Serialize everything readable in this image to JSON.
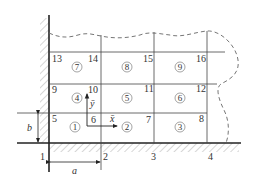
{
  "diagram": {
    "type": "finite element mesh of rectangular elements next to a wall and ground",
    "grid": {
      "x_lines": [
        49,
        101,
        154,
        207
      ],
      "y_lines": [
        52,
        84,
        113,
        143
      ]
    },
    "nodes": [
      {
        "id": "1",
        "label": "1",
        "x": 40,
        "y": 160
      },
      {
        "id": "2",
        "label": "2",
        "x": 103,
        "y": 160
      },
      {
        "id": "3",
        "label": "3",
        "x": 151,
        "y": 160
      },
      {
        "id": "4",
        "label": "4",
        "x": 208,
        "y": 160
      },
      {
        "id": "5",
        "label": "5",
        "x": 52,
        "y": 121
      },
      {
        "id": "6",
        "label": "6",
        "x": 91,
        "y": 122
      },
      {
        "id": "7",
        "label": "7",
        "x": 146,
        "y": 122
      },
      {
        "id": "8",
        "label": "8",
        "x": 199,
        "y": 121
      },
      {
        "id": "9",
        "label": "9",
        "x": 52,
        "y": 92
      },
      {
        "id": "10",
        "label": "10",
        "x": 88,
        "y": 92
      },
      {
        "id": "11",
        "label": "11",
        "x": 144,
        "y": 92
      },
      {
        "id": "12",
        "label": "12",
        "x": 197,
        "y": 92
      },
      {
        "id": "13",
        "label": "13",
        "x": 52,
        "y": 61
      },
      {
        "id": "14",
        "label": "14",
        "x": 88,
        "y": 61
      },
      {
        "id": "15",
        "label": "15",
        "x": 143,
        "y": 61
      },
      {
        "id": "16",
        "label": "16",
        "x": 197,
        "y": 61
      }
    ],
    "elements": [
      {
        "id": "e1",
        "label": "1",
        "cx": 75,
        "cy": 129
      },
      {
        "id": "e2",
        "label": "2",
        "cx": 127,
        "cy": 129
      },
      {
        "id": "e3",
        "label": "3",
        "cx": 180,
        "cy": 129
      },
      {
        "id": "e4",
        "label": "4",
        "cx": 75,
        "cy": 98
      },
      {
        "id": "e5",
        "label": "5",
        "cx": 127,
        "cy": 98
      },
      {
        "id": "e6",
        "label": "6",
        "cx": 180,
        "cy": 98
      },
      {
        "id": "e7",
        "label": "7",
        "cx": 75,
        "cy": 67
      },
      {
        "id": "e8",
        "label": "8",
        "cx": 127,
        "cy": 67
      },
      {
        "id": "e9",
        "label": "9",
        "cx": 180,
        "cy": 67
      }
    ],
    "local_axes": {
      "x_label": "x̄",
      "y_label": "ȳ"
    },
    "dimensions": {
      "a_label": "a",
      "b_label": "b"
    }
  }
}
